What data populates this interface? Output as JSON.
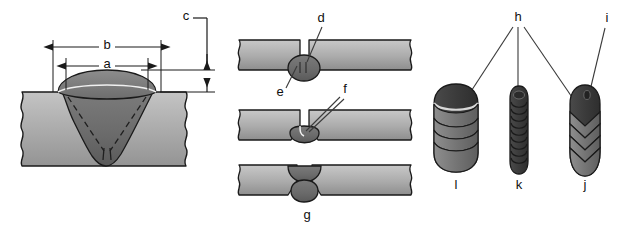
{
  "figure": {
    "background_color": "#ffffff"
  },
  "colors": {
    "base_metal": "#a9a9a9",
    "base_metal_light": "#c2c2c2",
    "base_metal_dark": "#8f8f8f",
    "weld_metal": "#6e6e6e",
    "weld_metal_dark": "#545454",
    "weld_cap_light": "#8a8a8a",
    "bead_dark": "#3a3a3a",
    "bead_mid": "#777777",
    "bead_light": "#9d9d9d",
    "outline": "#1a1a1a",
    "leader": "#3a3a3a",
    "label_text": "#101010"
  },
  "panels": {
    "left": {
      "name": "groove-weld-cross-section",
      "dimensions": [
        {
          "id": "a",
          "label": "a",
          "type": "horizontal",
          "description": "weld face width inner"
        },
        {
          "id": "b",
          "label": "b",
          "type": "horizontal",
          "description": "weld bead overall width"
        },
        {
          "id": "c",
          "label": "c",
          "type": "vertical",
          "description": "weld reinforcement height"
        }
      ]
    },
    "middle": {
      "name": "root-pass-cross-sections",
      "rows": [
        {
          "id": "row-1",
          "callouts": [
            {
              "id": "d",
              "label": "d",
              "description": "root pass face"
            },
            {
              "id": "e",
              "label": "e",
              "description": "root penetration underside"
            }
          ]
        },
        {
          "id": "row-2",
          "callouts": [
            {
              "id": "f",
              "label": "f",
              "description": "incomplete root fusion"
            }
          ]
        },
        {
          "id": "row-3",
          "callouts": [
            {
              "id": "g",
              "label": "g",
              "description": "excessive root penetration"
            }
          ]
        }
      ]
    },
    "right": {
      "name": "weld-bead-surface-appearance",
      "callouts": [
        {
          "id": "h",
          "label": "h",
          "description": "bead ripple pattern"
        },
        {
          "id": "i",
          "label": "i",
          "description": "bead crater"
        }
      ],
      "beads": [
        {
          "id": "l",
          "label": "l",
          "description": "wide weave bead with rounded ripples"
        },
        {
          "id": "k",
          "label": "k",
          "description": "narrow stringer bead with tight ripples"
        },
        {
          "id": "j",
          "label": "j",
          "description": "bead with chevron ripple pattern"
        }
      ]
    }
  }
}
